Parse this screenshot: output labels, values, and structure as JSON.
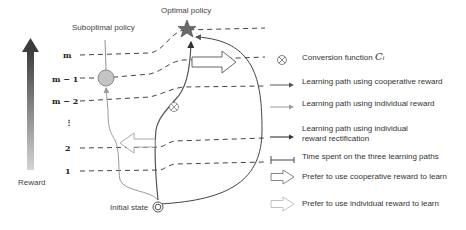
{
  "diagram": {
    "labels": {
      "optimal_policy": "Optimal policy",
      "suboptimal_policy": "Suboptimal policy",
      "initial_state": "Initial state",
      "reward_axis": "Reward"
    },
    "reward_levels": [
      "m",
      "m − 1",
      "m − 2",
      "⋮",
      "2",
      "1"
    ],
    "colors": {
      "cooperative_path": "#555555",
      "individual_path": "#9a9a9a",
      "rectification_path": "#3a3a3a",
      "star_fill": "#6a6a6a",
      "suboptimal_fill": "#c4c4c4",
      "reward_arrow_top": "#3c3c3c",
      "reward_arrow_bottom": "#d0d0d0"
    }
  },
  "legend": {
    "items": [
      {
        "icon": "conversion-function-icon",
        "label": "Conversion function ",
        "math": "Cᵢ"
      },
      {
        "icon": "cooperative-path-arrow-icon",
        "label": "Learning path using cooperative reward"
      },
      {
        "icon": "individual-path-arrow-icon",
        "label": "Learning path using individual reward"
      },
      {
        "icon": "rectification-path-arrow-icon",
        "label": "Learning path using individual reward rectification"
      },
      {
        "icon": "time-span-icon",
        "label": "Time spent on the three learning paths"
      },
      {
        "icon": "cooperative-preference-arrow-icon",
        "label": "Prefer to use cooperative reward to learn"
      },
      {
        "icon": "individual-preference-arrow-icon",
        "label": "Prefer to use individual reward to learn"
      }
    ]
  }
}
